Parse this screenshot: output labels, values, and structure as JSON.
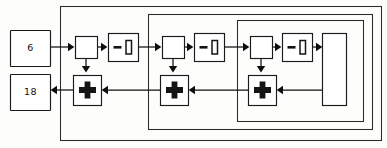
{
  "diagram": {
    "type": "block-diagram",
    "canvas": {
      "width": 387,
      "height": 148
    },
    "input": {
      "label": "6",
      "name": "input-value-box",
      "x": 10,
      "y": 30,
      "w": 40,
      "h": 36
    },
    "output": {
      "label": "18",
      "name": "output-value-box",
      "x": 10,
      "y": 74,
      "w": 40,
      "h": 36
    },
    "stages": [
      {
        "index": 1,
        "junction": {
          "x": 75,
          "y": 36,
          "w": 22,
          "h": 22
        },
        "delay": {
          "label": "-1",
          "x": 108,
          "y": 33,
          "w": 30,
          "h": 28
        },
        "sum": {
          "label": "+",
          "x": 73,
          "y": 75,
          "w": 28,
          "h": 30
        }
      },
      {
        "index": 2,
        "junction": {
          "x": 162,
          "y": 36,
          "w": 22,
          "h": 22
        },
        "delay": {
          "label": "-1",
          "x": 194,
          "y": 33,
          "w": 30,
          "h": 28
        },
        "sum": {
          "label": "+",
          "x": 160,
          "y": 75,
          "w": 28,
          "h": 30
        }
      },
      {
        "index": 3,
        "junction": {
          "x": 250,
          "y": 36,
          "w": 22,
          "h": 22
        },
        "delay": {
          "label": "-1",
          "x": 282,
          "y": 33,
          "w": 30,
          "h": 28
        },
        "sum": {
          "label": "+",
          "x": 248,
          "y": 75,
          "w": 28,
          "h": 30
        }
      }
    ],
    "terminal_box": {
      "label": "",
      "name": "terminal-block",
      "x": 322,
      "y": 33,
      "w": 24,
      "h": 72
    },
    "loops": [
      {
        "name": "outer-feedback-loop",
        "x": 60,
        "y": 6,
        "w": 322,
        "h": 135
      },
      {
        "name": "middle-feedback-loop",
        "x": 148,
        "y": 14,
        "w": 225,
        "h": 116
      },
      {
        "name": "inner-feedback-loop",
        "x": 237,
        "y": 20,
        "w": 127,
        "h": 102
      }
    ],
    "colors": {
      "stroke": "#1a1a1a",
      "background": "#fdfdfb",
      "glyph": "#141414"
    }
  }
}
